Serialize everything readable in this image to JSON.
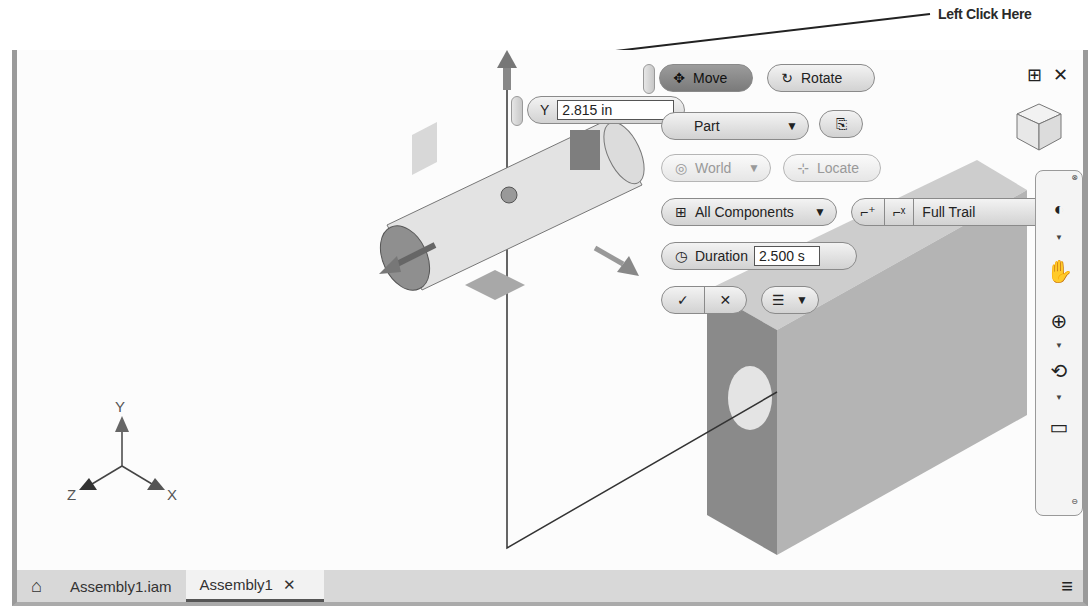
{
  "annotation": {
    "text": "Left Click Here"
  },
  "minitoolbar": {
    "move_label": "Move",
    "rotate_label": "Rotate",
    "axis_label": "Y",
    "axis_value": "2.815 in",
    "select_filter": "Part",
    "coordinate_space": "World",
    "locate_label": "Locate",
    "components_filter": "All Components",
    "trail_option": "Full Trail",
    "duration_label": "Duration",
    "duration_value": "2.500 s",
    "ok_symbol": "✓",
    "cancel_symbol": "✕"
  },
  "viewport_controls": {
    "split_symbol": "⊞",
    "close_symbol": "✕"
  },
  "triad": {
    "x_label": "X",
    "y_label": "Y",
    "z_label": "Z"
  },
  "viewcube": {
    "top": "TOP",
    "front": "FRONT",
    "right": "RIGHT"
  },
  "tabs": [
    {
      "label": "Assembly1.iam",
      "active": false
    },
    {
      "label": "Assembly1",
      "active": true,
      "close": "✕"
    }
  ]
}
